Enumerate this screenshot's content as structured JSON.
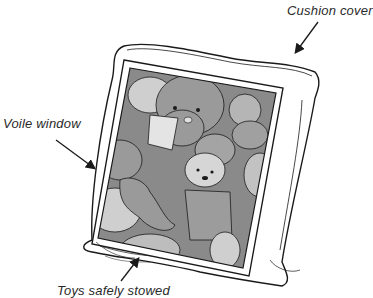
{
  "diagram": {
    "labels": {
      "cushion_cover": "Cushion cover",
      "voile_window": "Voile window",
      "toys_stowed": "Toys safely stowed"
    },
    "colors": {
      "outline": "#1a1a1a",
      "toy_dark": "#8a8a8a",
      "toy_mid": "#a9a9a9",
      "toy_light": "#cfcfcf",
      "background": "#ffffff"
    }
  }
}
